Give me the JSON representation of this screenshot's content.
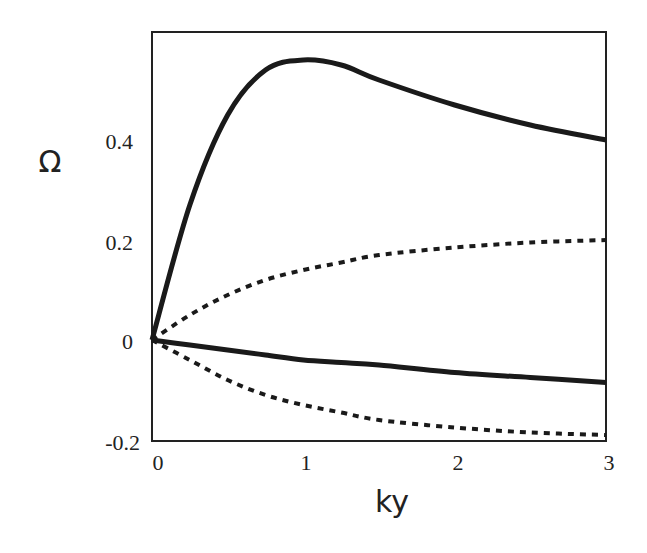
{
  "chart_data": {
    "type": "line",
    "title": "",
    "xlabel": "ky",
    "ylabel": "Ω",
    "xlim": [
      0,
      3
    ],
    "ylim": [
      -0.2,
      0.6
    ],
    "grid": false,
    "legend": null,
    "x_ticks": [
      "0",
      "1",
      "2",
      "3"
    ],
    "y_ticks": [
      "-0.2",
      "0",
      "0.2",
      "0.4"
    ],
    "x": [
      0,
      0.25,
      0.5,
      0.75,
      1.0,
      1.25,
      1.5,
      2.0,
      2.5,
      3.0
    ],
    "series": [
      {
        "name": "upper solid",
        "style": "solid",
        "values": [
          0.0,
          0.27,
          0.45,
          0.54,
          0.56,
          0.55,
          0.52,
          0.47,
          0.43,
          0.4
        ]
      },
      {
        "name": "upper dotted",
        "style": "dotted",
        "values": [
          0.0,
          0.05,
          0.09,
          0.12,
          0.14,
          0.155,
          0.17,
          0.185,
          0.195,
          0.2
        ]
      },
      {
        "name": "lower solid",
        "style": "solid",
        "values": [
          0.0,
          -0.01,
          -0.02,
          -0.03,
          -0.04,
          -0.045,
          -0.05,
          -0.065,
          -0.075,
          -0.085
        ]
      },
      {
        "name": "lower dotted",
        "style": "dotted",
        "values": [
          0.0,
          -0.04,
          -0.08,
          -0.11,
          -0.13,
          -0.145,
          -0.16,
          -0.175,
          -0.185,
          -0.19
        ]
      }
    ]
  },
  "axes": {
    "xlabel": "ky",
    "ylabel": "Ω",
    "x_ticks": [
      "0",
      "1",
      "2",
      "3"
    ],
    "y_ticks": [
      "-0.2",
      "0",
      "0.2",
      "0.4"
    ]
  }
}
